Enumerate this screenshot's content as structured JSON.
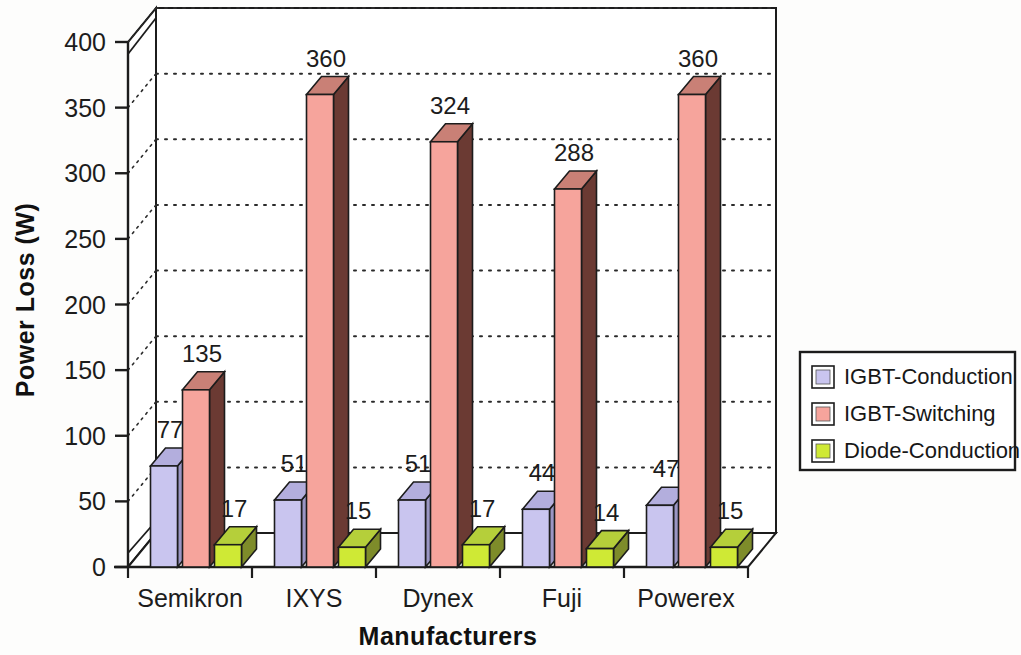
{
  "chart_data": {
    "type": "bar",
    "title": "",
    "xlabel": "Manufacturers",
    "ylabel": "Power Loss (W)",
    "categories": [
      "Semikron",
      "IXYS",
      "Dynex",
      "Fuji",
      "Powerex"
    ],
    "series": [
      {
        "name": "IGBT-Conduction",
        "color": "#c9c5ef",
        "side_color": "#9a96c4",
        "top_color": "#b3aedd",
        "values": [
          77,
          51,
          51,
          44,
          47
        ]
      },
      {
        "name": "IGBT-Switching",
        "color": "#f6a49c",
        "side_color": "#6b3a33",
        "top_color": "#c98076",
        "values": [
          135,
          360,
          324,
          288,
          360
        ]
      },
      {
        "name": "Diode-Conduction",
        "color": "#cfe935",
        "side_color": "#7e8c2a",
        "top_color": "#b5cf3a",
        "values": [
          17,
          15,
          17,
          14,
          15
        ]
      }
    ],
    "ylim": [
      0,
      400
    ],
    "yticks": [
      0,
      50,
      100,
      150,
      200,
      250,
      300,
      350,
      400
    ],
    "ytick_labels": [
      "0",
      "50",
      "100",
      "150",
      "200",
      "250",
      "300",
      "350",
      "400"
    ],
    "grid": true,
    "grid_style": "dotted",
    "legend_position": "right",
    "projection": "3d"
  },
  "legend": {
    "items": [
      {
        "label": "IGBT-Conduction",
        "swatch": "#c9c5ef"
      },
      {
        "label": "IGBT-Switching",
        "swatch": "#f6a49c"
      },
      {
        "label": "Diode-Conduction",
        "swatch": "#cfe935"
      }
    ]
  }
}
